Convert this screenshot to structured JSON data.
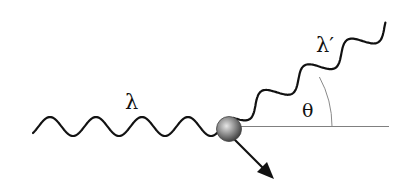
{
  "diagram": {
    "labels": {
      "incident_wavelength": "λ",
      "scattered_wavelength": "λ′",
      "scattering_angle": "θ"
    },
    "elements": {
      "incident_photon": "incoming wave",
      "electron": "target particle",
      "recoil": "recoil electron arrow",
      "scattered_photon": "scattered wave",
      "reference_axis": "horizontal reference line"
    },
    "colors": {
      "wave": "#111111",
      "line": "#7a7a7a",
      "ball_light": "#d8d8d8",
      "ball_dark": "#4a4a4a",
      "arrow": "#111111"
    }
  }
}
